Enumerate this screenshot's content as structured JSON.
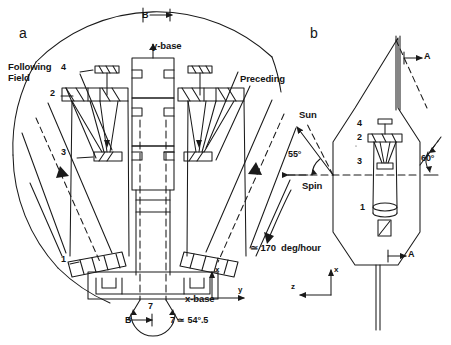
{
  "figure": {
    "kind": "technical-line-drawing",
    "panels": [
      {
        "id": "a",
        "label": "a",
        "view": "plan-view"
      },
      {
        "id": "b",
        "label": "b",
        "view": "side-view"
      }
    ]
  },
  "panel_a": {
    "label": "a",
    "section_marker_top": "B",
    "section_marker_bottom": "B",
    "y_base_label": "y-base",
    "x_base_label": "x-base",
    "following_field_label": "Following\nField",
    "following_field_line1": "Following",
    "following_field_line2": "Field",
    "preceding_label": "Preceding",
    "component_numbers": {
      "left": [
        "4",
        "2",
        "3",
        "1"
      ],
      "right": [
        "4",
        "2",
        "3",
        "1"
      ]
    },
    "left_4": "4",
    "left_2": "2",
    "left_3": "3",
    "left_1": "1",
    "angle_symbol": "7",
    "angle_note": "7 ≃ 54°.5",
    "angle_value": "54",
    "angle_decimal": ".5",
    "axes": {
      "vertical_label": "x",
      "horizontal_label": "y"
    }
  },
  "panel_b": {
    "label": "b",
    "section_marker_upper": "A",
    "section_marker_lower": "A",
    "sun_label": "Sun",
    "spin_label": "Spin",
    "sun_angle": "55°",
    "sun_angle_value": "55",
    "right_angle": "60°",
    "right_angle_value": "60",
    "rotation_rate": "≃ 170  deg/hour",
    "component_numbers": [
      "4",
      "2",
      "3",
      "1"
    ],
    "num_4": "4",
    "num_2": "2",
    "num_3": "3",
    "num_1": "1",
    "axes": {
      "vertical_label": "x",
      "horizontal_label": "z"
    }
  },
  "style": {
    "ink": "#1a1a1a",
    "paper": "#ffffff",
    "line_width": "1.1"
  }
}
